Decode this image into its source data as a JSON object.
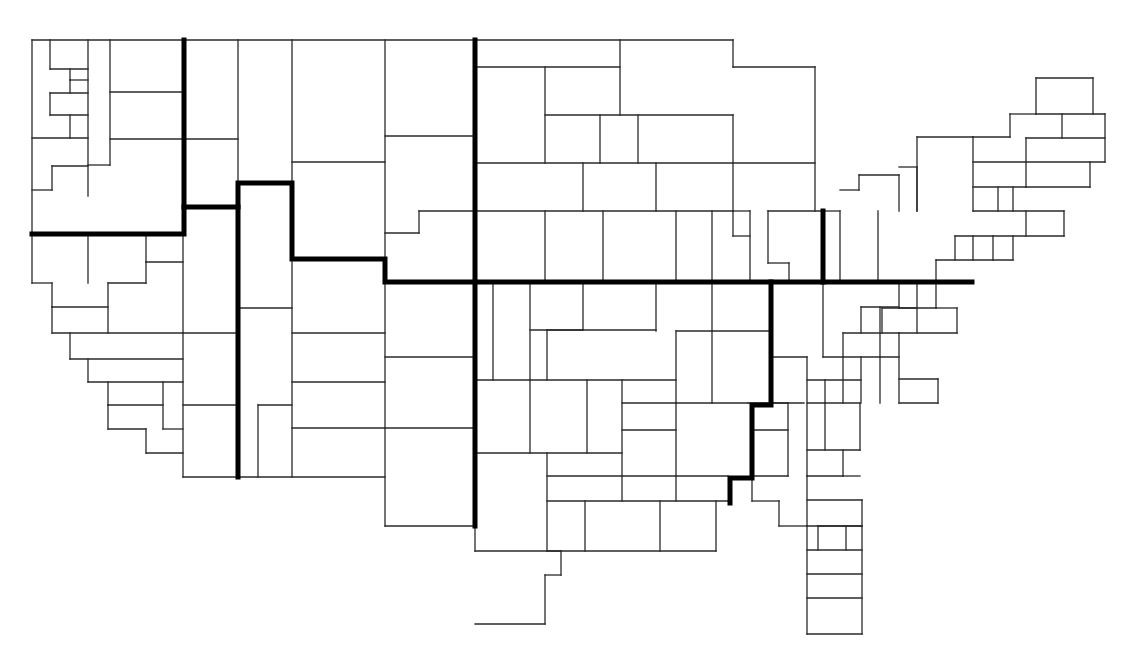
{
  "diagram": {
    "type": "rectangular-cartogram",
    "background": "#ffffff",
    "line_color": "#2a2a2a",
    "boundary_color": "#000000",
    "thin_segments": [
      [
        32,
        40,
        475,
        40
      ],
      [
        475,
        40,
        733,
        40
      ],
      [
        733,
        40,
        733,
        67
      ],
      [
        733,
        67,
        815,
        67
      ],
      [
        815,
        67,
        815,
        211
      ],
      [
        32,
        40,
        32,
        283
      ],
      [
        32,
        283,
        52,
        283
      ],
      [
        50,
        40,
        50,
        69
      ],
      [
        50,
        69,
        88,
        69
      ],
      [
        70,
        69,
        70,
        80
      ],
      [
        70,
        80,
        88,
        80
      ],
      [
        70,
        80,
        70,
        93
      ],
      [
        50,
        93,
        88,
        93
      ],
      [
        50,
        93,
        50,
        115
      ],
      [
        50,
        115,
        88,
        115
      ],
      [
        70,
        115,
        70,
        138
      ],
      [
        32,
        138,
        88,
        138
      ],
      [
        88,
        40,
        88,
        196
      ],
      [
        110,
        40,
        110,
        165
      ],
      [
        88,
        165,
        110,
        165
      ],
      [
        52,
        166,
        88,
        166
      ],
      [
        52,
        166,
        52,
        190
      ],
      [
        32,
        190,
        52,
        190
      ],
      [
        110,
        92,
        183,
        92
      ],
      [
        110,
        139,
        183,
        139
      ],
      [
        88,
        236,
        88,
        283
      ],
      [
        146,
        236,
        146,
        262
      ],
      [
        146,
        262,
        183,
        262
      ],
      [
        108,
        283,
        146,
        283
      ],
      [
        146,
        262,
        146,
        283
      ],
      [
        52,
        283,
        52,
        307
      ],
      [
        52,
        307,
        108,
        307
      ],
      [
        108,
        283,
        108,
        333
      ],
      [
        52,
        307,
        52,
        333
      ],
      [
        52,
        333,
        183,
        333
      ],
      [
        70,
        333,
        70,
        359
      ],
      [
        70,
        359,
        183,
        359
      ],
      [
        88,
        359,
        88,
        382
      ],
      [
        88,
        382,
        183,
        382
      ],
      [
        108,
        382,
        108,
        405
      ],
      [
        108,
        405,
        163,
        405
      ],
      [
        108,
        405,
        108,
        429
      ],
      [
        108,
        429,
        146,
        429
      ],
      [
        163,
        382,
        163,
        429
      ],
      [
        163,
        429,
        183,
        429
      ],
      [
        146,
        429,
        146,
        453
      ],
      [
        146,
        453,
        183,
        453
      ],
      [
        183,
        236,
        183,
        477
      ],
      [
        183,
        477,
        385,
        477
      ],
      [
        238,
        40,
        238,
        183
      ],
      [
        183,
        139,
        238,
        139
      ],
      [
        292,
        40,
        292,
        183
      ],
      [
        292,
        162,
        385,
        162
      ],
      [
        385,
        40,
        385,
        280
      ],
      [
        385,
        136,
        475,
        136
      ],
      [
        385,
        233,
        419,
        233
      ],
      [
        419,
        233,
        419,
        211
      ],
      [
        419,
        211,
        475,
        211
      ],
      [
        238,
        236,
        238,
        477
      ],
      [
        238,
        308,
        292,
        308
      ],
      [
        292,
        262,
        292,
        477
      ],
      [
        183,
        333,
        238,
        333
      ],
      [
        183,
        405,
        238,
        405
      ],
      [
        258,
        405,
        292,
        405
      ],
      [
        258,
        405,
        258,
        477
      ],
      [
        292,
        333,
        385,
        333
      ],
      [
        292,
        382,
        385,
        382
      ],
      [
        292,
        428,
        385,
        428
      ],
      [
        385,
        280,
        385,
        526
      ],
      [
        385,
        357,
        475,
        357
      ],
      [
        385,
        428,
        475,
        428
      ],
      [
        385,
        526,
        475,
        526
      ],
      [
        475,
        67,
        620,
        67
      ],
      [
        620,
        40,
        620,
        115
      ],
      [
        545,
        67,
        545,
        163
      ],
      [
        475,
        163,
        733,
        163
      ],
      [
        545,
        115,
        733,
        115
      ],
      [
        600,
        115,
        600,
        163
      ],
      [
        638,
        115,
        638,
        163
      ],
      [
        583,
        163,
        583,
        211
      ],
      [
        656,
        163,
        656,
        211
      ],
      [
        733,
        115,
        733,
        211
      ],
      [
        733,
        163,
        815,
        163
      ],
      [
        475,
        211,
        733,
        211
      ],
      [
        545,
        211,
        545,
        283
      ],
      [
        603,
        211,
        603,
        283
      ],
      [
        676,
        211,
        676,
        283
      ],
      [
        712,
        211,
        712,
        283
      ],
      [
        733,
        211,
        733,
        236
      ],
      [
        733,
        236,
        750,
        236
      ],
      [
        750,
        211,
        750,
        283
      ],
      [
        733,
        211,
        750,
        211
      ],
      [
        768,
        211,
        768,
        263
      ],
      [
        768,
        263,
        789,
        263
      ],
      [
        789,
        263,
        789,
        283
      ],
      [
        768,
        211,
        823,
        211
      ],
      [
        823,
        211,
        840,
        211
      ],
      [
        840,
        211,
        840,
        283
      ],
      [
        878,
        211,
        878,
        283
      ],
      [
        840,
        190,
        859,
        190
      ],
      [
        859,
        190,
        859,
        175
      ],
      [
        859,
        175,
        899,
        175
      ],
      [
        899,
        175,
        899,
        211
      ],
      [
        899,
        167,
        917,
        167
      ],
      [
        917,
        167,
        917,
        211
      ],
      [
        917,
        137,
        973,
        137
      ],
      [
        917,
        137,
        917,
        211
      ],
      [
        973,
        137,
        973,
        211
      ],
      [
        973,
        137,
        1010,
        137
      ],
      [
        1010,
        137,
        1010,
        114
      ],
      [
        1010,
        114,
        1036,
        114
      ],
      [
        1036,
        114,
        1036,
        78
      ],
      [
        1036,
        78,
        1093,
        78
      ],
      [
        1093,
        78,
        1093,
        114
      ],
      [
        1036,
        114,
        1105,
        114
      ],
      [
        1062,
        114,
        1062,
        138
      ],
      [
        1105,
        114,
        1105,
        162
      ],
      [
        1026,
        138,
        1105,
        138
      ],
      [
        1026,
        138,
        1026,
        162
      ],
      [
        973,
        162,
        1105,
        162
      ],
      [
        1026,
        162,
        1026,
        187
      ],
      [
        1026,
        187,
        1090,
        187
      ],
      [
        1090,
        162,
        1090,
        187
      ],
      [
        973,
        187,
        1026,
        187
      ],
      [
        1013,
        187,
        1013,
        211
      ],
      [
        998,
        187,
        998,
        211
      ],
      [
        973,
        211,
        1064,
        211
      ],
      [
        1064,
        211,
        1064,
        236
      ],
      [
        1026,
        211,
        1026,
        236
      ],
      [
        955,
        236,
        1064,
        236
      ],
      [
        955,
        236,
        955,
        260
      ],
      [
        936,
        260,
        1013,
        260
      ],
      [
        1013,
        236,
        1013,
        260
      ],
      [
        973,
        236,
        973,
        260
      ],
      [
        993,
        236,
        993,
        260
      ],
      [
        936,
        260,
        936,
        283
      ],
      [
        899,
        283,
        899,
        308
      ],
      [
        899,
        308,
        936,
        308
      ],
      [
        936,
        283,
        936,
        308
      ],
      [
        917,
        283,
        917,
        333
      ],
      [
        882,
        308,
        917,
        308
      ],
      [
        882,
        308,
        882,
        333
      ],
      [
        475,
        283,
        475,
        551
      ],
      [
        493,
        283,
        493,
        380
      ],
      [
        530,
        283,
        530,
        380
      ],
      [
        530,
        330,
        583,
        330
      ],
      [
        583,
        283,
        583,
        330
      ],
      [
        547,
        330,
        547,
        380
      ],
      [
        547,
        330,
        656,
        330
      ],
      [
        656,
        283,
        656,
        331
      ],
      [
        712,
        283,
        712,
        331
      ],
      [
        676,
        331,
        771,
        331
      ],
      [
        676,
        331,
        676,
        403
      ],
      [
        712,
        331,
        712,
        403
      ],
      [
        475,
        380,
        676,
        380
      ],
      [
        530,
        380,
        530,
        453
      ],
      [
        587,
        380,
        587,
        453
      ],
      [
        622,
        380,
        622,
        476
      ],
      [
        622,
        403,
        676,
        403
      ],
      [
        676,
        403,
        748,
        403
      ],
      [
        475,
        453,
        622,
        453
      ],
      [
        547,
        453,
        547,
        551
      ],
      [
        622,
        430,
        676,
        430
      ],
      [
        676,
        403,
        676,
        476
      ],
      [
        547,
        476,
        728,
        476
      ],
      [
        622,
        476,
        622,
        501
      ],
      [
        676,
        476,
        676,
        501
      ],
      [
        547,
        501,
        728,
        501
      ],
      [
        585,
        501,
        585,
        551
      ],
      [
        660,
        501,
        660,
        551
      ],
      [
        716,
        501,
        716,
        551
      ],
      [
        547,
        551,
        716,
        551
      ],
      [
        475,
        551,
        561,
        551
      ],
      [
        561,
        551,
        561,
        575
      ],
      [
        545,
        575,
        561,
        575
      ],
      [
        545,
        575,
        545,
        624
      ],
      [
        475,
        624,
        545,
        624
      ],
      [
        771,
        283,
        771,
        357
      ],
      [
        771,
        357,
        807,
        357
      ],
      [
        823,
        283,
        823,
        357
      ],
      [
        823,
        357,
        899,
        357
      ],
      [
        843,
        333,
        843,
        357
      ],
      [
        843,
        333,
        899,
        333
      ],
      [
        861,
        307,
        861,
        333
      ],
      [
        861,
        307,
        899,
        307
      ],
      [
        880,
        307,
        880,
        357
      ],
      [
        899,
        333,
        899,
        403
      ],
      [
        899,
        333,
        957,
        333
      ],
      [
        957,
        308,
        957,
        333
      ],
      [
        936,
        308,
        957,
        308
      ],
      [
        771,
        403,
        804,
        403
      ],
      [
        807,
        357,
        807,
        476
      ],
      [
        807,
        380,
        861,
        380
      ],
      [
        825,
        380,
        825,
        403
      ],
      [
        843,
        357,
        843,
        403
      ],
      [
        861,
        357,
        861,
        403
      ],
      [
        880,
        357,
        880,
        403
      ],
      [
        899,
        379,
        938,
        379
      ],
      [
        938,
        379,
        938,
        403
      ],
      [
        899,
        403,
        938,
        403
      ],
      [
        748,
        403,
        788,
        403
      ],
      [
        752,
        430,
        788,
        430
      ],
      [
        788,
        403,
        788,
        476
      ],
      [
        752,
        476,
        788,
        476
      ],
      [
        752,
        476,
        752,
        501
      ],
      [
        752,
        501,
        779,
        501
      ],
      [
        779,
        501,
        779,
        526
      ],
      [
        779,
        526,
        807,
        526
      ],
      [
        807,
        403,
        860,
        403
      ],
      [
        825,
        403,
        825,
        450
      ],
      [
        807,
        450,
        860,
        450
      ],
      [
        860,
        403,
        860,
        450
      ],
      [
        843,
        450,
        843,
        476
      ],
      [
        843,
        476,
        860,
        476
      ],
      [
        807,
        476,
        807,
        526
      ],
      [
        807,
        476,
        843,
        476
      ],
      [
        807,
        500,
        862,
        500
      ],
      [
        862,
        500,
        862,
        526
      ],
      [
        818,
        526,
        862,
        526
      ],
      [
        818,
        526,
        818,
        550
      ],
      [
        846,
        526,
        846,
        550
      ],
      [
        807,
        526,
        862,
        526
      ],
      [
        807,
        550,
        862,
        550
      ],
      [
        807,
        574,
        862,
        574
      ],
      [
        807,
        598,
        862,
        598
      ],
      [
        807,
        526,
        807,
        634
      ],
      [
        862,
        526,
        862,
        634
      ],
      [
        807,
        634,
        862,
        634
      ]
    ],
    "thick_boundaries": [
      {
        "name": "northwest-boundary",
        "points": "32,234 184,234 184,207 238,207 238,183 292,183 292,259 385,259 385,282 475,282"
      },
      {
        "name": "west-central-boundary",
        "points": "184,40 184,207"
      },
      {
        "name": "mountain-boundary",
        "points": "238,207 238,477"
      },
      {
        "name": "central-meridian-boundary",
        "points": "475,40 475,526"
      },
      {
        "name": "central-parallel-boundary",
        "points": "475,282 972,282"
      },
      {
        "name": "midwest-divider",
        "points": "823,211 823,282"
      },
      {
        "name": "southeast-boundary",
        "points": "771,282 771,405 752,405 752,478 730,478 730,503"
      }
    ]
  }
}
